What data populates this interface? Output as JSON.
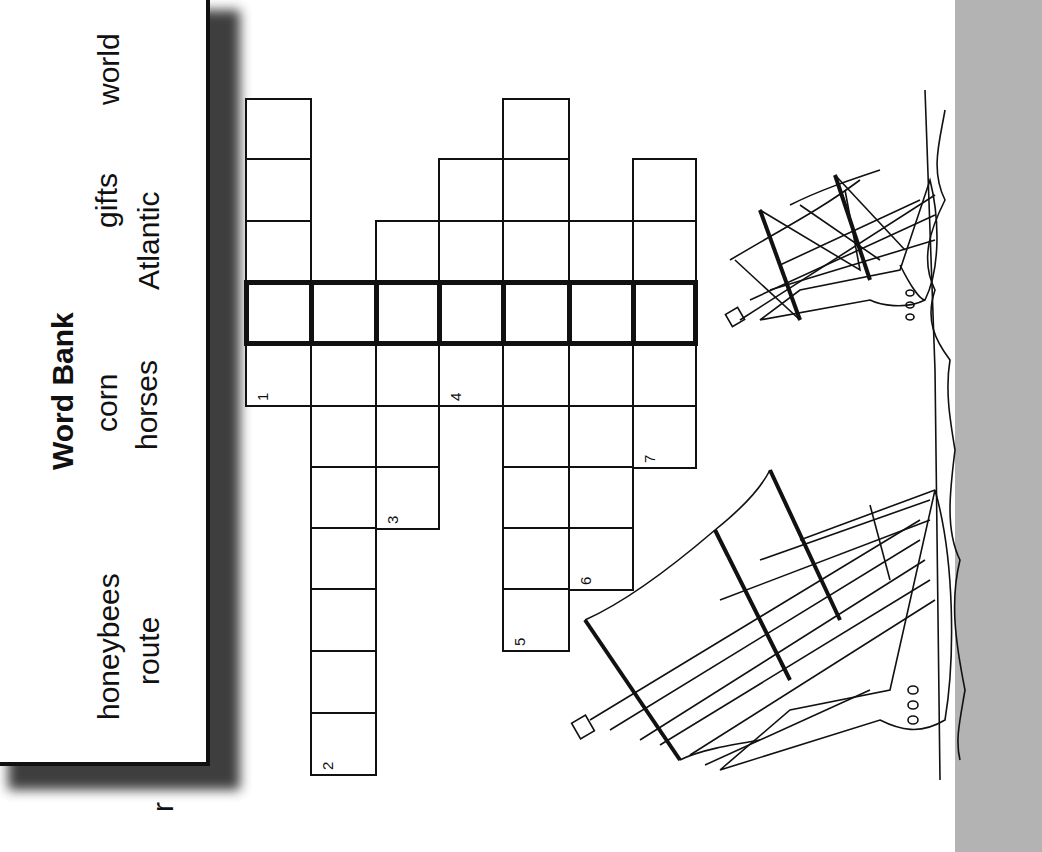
{
  "word_bank": {
    "title": "Word Bank",
    "words": [
      "honeybees",
      "route",
      "corn",
      "horses",
      "gifts",
      "Atlantic",
      "world"
    ]
  },
  "crossword": {
    "clue_numbers": [
      "1",
      "2",
      "3",
      "4",
      "5",
      "6",
      "7"
    ],
    "columns": [
      {
        "clue": "1",
        "x": 245,
        "w": 65,
        "rows": [
          98,
          158,
          220,
          281,
          343
        ],
        "cell_h": 62
      },
      {
        "clue": "2",
        "x": 310,
        "w": 65,
        "rows": [
          281,
          343,
          405,
          466,
          527,
          588,
          650,
          712
        ],
        "cell_h": 62
      },
      {
        "clue": "3",
        "x": 375,
        "w": 63,
        "rows": [
          220,
          281,
          343,
          405,
          466
        ],
        "cell_h": 62
      },
      {
        "clue": "4",
        "x": 438,
        "w": 64,
        "rows": [
          158,
          220,
          281,
          343
        ],
        "cell_h": 62
      },
      {
        "clue": "5",
        "x": 502,
        "w": 66,
        "rows": [
          98,
          158,
          220,
          281,
          343,
          405,
          466,
          527,
          588
        ],
        "cell_h": 62
      },
      {
        "clue": "6",
        "x": 568,
        "w": 64,
        "rows": [
          220,
          281,
          343,
          405,
          466,
          527
        ],
        "cell_h": 62
      },
      {
        "clue": "7",
        "x": 632,
        "w": 63,
        "rows": [
          158,
          220,
          281,
          343,
          405
        ],
        "cell_h": 62
      }
    ],
    "highlight_row": {
      "top": 281,
      "height": 62,
      "left": 245,
      "width": 450
    }
  },
  "illustration": {
    "subject": "two sailing ships near coastline"
  },
  "stray_glyph": "r",
  "colors": {
    "ink": "#111111",
    "side_strip": "#b3b3b3",
    "paper": "#ffffff"
  }
}
